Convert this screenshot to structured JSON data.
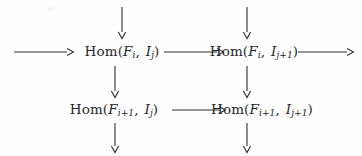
{
  "figure": {
    "type": "commutative-diagram",
    "background_color": "#fefefe",
    "ink_color": "#2f2f33"
  },
  "nodes": [
    {
      "id": "top-left",
      "label": "Hom(F_i, I_j)",
      "functor": "Hom",
      "open_paren": "(",
      "arg1_base": "F",
      "arg1_sub": "i",
      "comma": ",",
      "arg2_base": "I",
      "arg2_sub": "j",
      "close_paren": ")",
      "x": 122,
      "y": 52
    },
    {
      "id": "top-right",
      "label": "Hom(F_i, I_{j+1})",
      "functor": "Hom",
      "open_paren": "(",
      "arg1_base": "F",
      "arg1_sub": "i",
      "comma": ",",
      "arg2_base": "I",
      "arg2_sub": "j+1",
      "close_paren": ")",
      "x": 254,
      "y": 52
    },
    {
      "id": "bottom-left",
      "label": "Hom(F_{i+1}, I_j)",
      "functor": "Hom",
      "open_paren": "(",
      "arg1_base": "F",
      "arg1_sub": "i+1",
      "comma": ",",
      "arg2_base": "I",
      "arg2_sub": "j",
      "close_paren": ")",
      "x": 114,
      "y": 110
    },
    {
      "id": "bottom-right",
      "label": "Hom(F_{i+1}, I_{j+1})",
      "functor": "Hom",
      "open_paren": "(",
      "arg1_base": "F",
      "arg1_sub": "i+1",
      "comma": ",",
      "arg2_base": "I",
      "arg2_sub": "j+1",
      "close_paren": ")",
      "x": 262,
      "y": 110
    }
  ],
  "arrows": [
    {
      "id": "in-left",
      "direction": "right",
      "label": ""
    },
    {
      "id": "top-row-middle",
      "direction": "right",
      "label": ""
    },
    {
      "id": "out-right",
      "direction": "right",
      "label": ""
    },
    {
      "id": "bottom-row-middle",
      "direction": "right",
      "label": ""
    },
    {
      "id": "col-left-top",
      "direction": "down",
      "label": ""
    },
    {
      "id": "col-right-top",
      "direction": "down",
      "label": ""
    },
    {
      "id": "col-left-middle",
      "direction": "down",
      "label": ""
    },
    {
      "id": "col-right-middle",
      "direction": "down",
      "label": ""
    },
    {
      "id": "col-left-bottom",
      "direction": "down",
      "label": ""
    },
    {
      "id": "col-right-bottom",
      "direction": "down",
      "label": ""
    }
  ]
}
